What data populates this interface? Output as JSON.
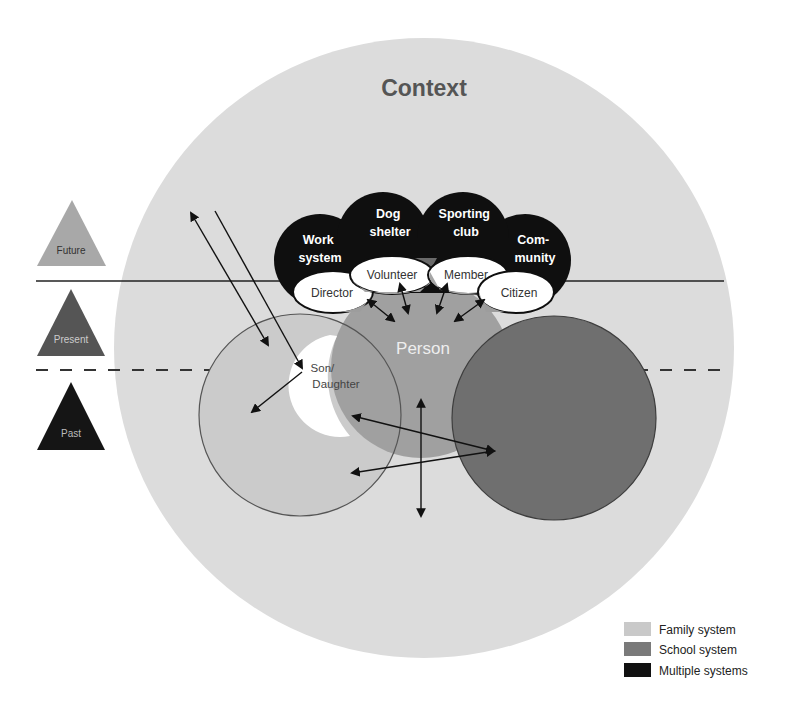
{
  "title": "Context",
  "timeline": {
    "future": "Future",
    "present": "Present",
    "past": "Past"
  },
  "systems": {
    "work": [
      "Work",
      "system"
    ],
    "dog_shelter": [
      "Dog",
      "shelter"
    ],
    "sporting_club": [
      "Sporting",
      "club"
    ],
    "community": [
      "Com-",
      "munity"
    ]
  },
  "roles": {
    "director": "Director",
    "volunteer": "Volunteer",
    "member": "Member",
    "citizen": "Citizen",
    "son_daughter": [
      "Son/",
      "Daughter"
    ]
  },
  "person": "Person",
  "legend": [
    {
      "label": "Family system",
      "color": "#c9c9c9"
    },
    {
      "label": "School system",
      "color": "#7a7a7a"
    },
    {
      "label": "Multiple systems",
      "color": "#111111"
    }
  ],
  "colors": {
    "context": "#dcdcdc",
    "family": "#c9c9c9",
    "school": "#6f6f6f",
    "person": "#9d9d9d",
    "multiple": "#0f0f0f",
    "future_triangle": "#a8a8a8",
    "present_triangle": "#555555",
    "past_triangle": "#151515"
  }
}
